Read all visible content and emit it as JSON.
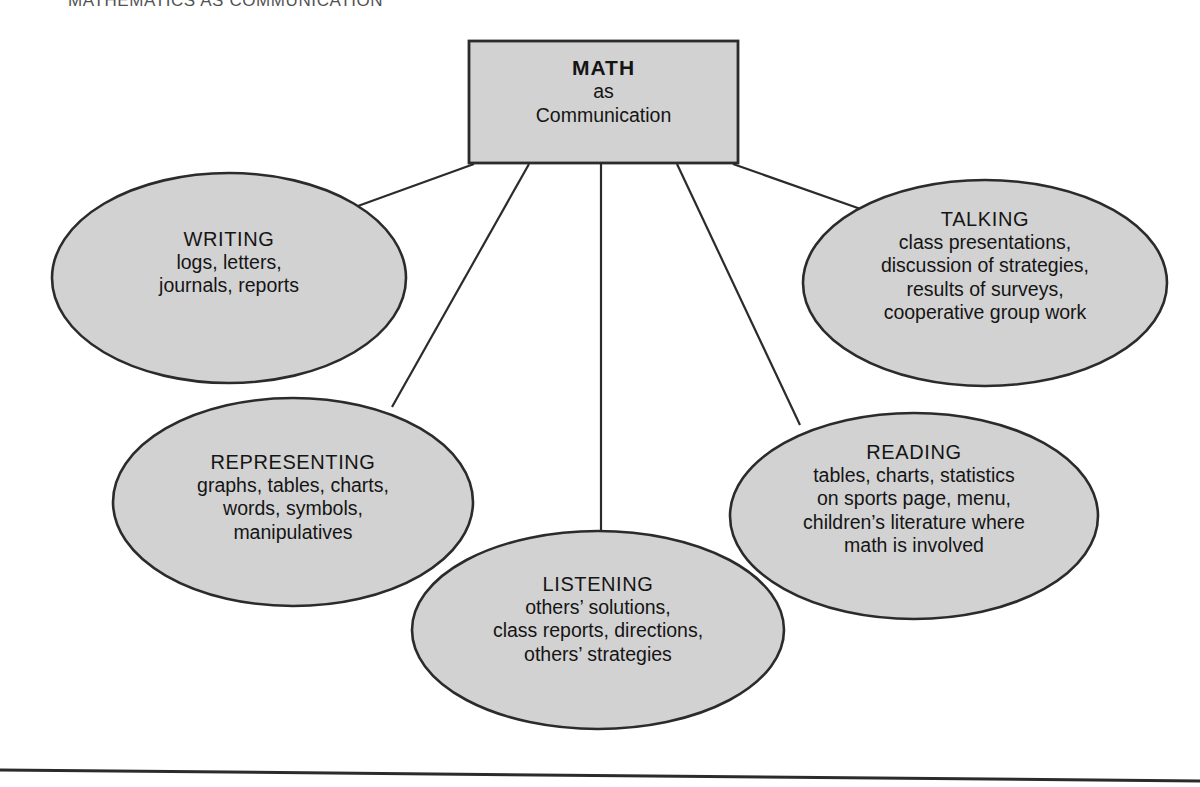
{
  "page": {
    "running_head": "MATHEMATICS AS COMMUNICATION",
    "background_color": "#ffffff",
    "shape_fill_color": "#d2d2d2",
    "shape_stroke_color": "#2b2b2b",
    "text_color": "#151515"
  },
  "center": {
    "title": "MATH",
    "line1": "as",
    "line2": "Communication"
  },
  "nodes": [
    {
      "id": "writing",
      "title": "WRITING",
      "lines": [
        "logs, letters,",
        "journals, reports"
      ]
    },
    {
      "id": "talking",
      "title": "TALKING",
      "lines": [
        "class presentations,",
        "discussion of strategies,",
        "results of surveys,",
        "cooperative group work"
      ]
    },
    {
      "id": "representing",
      "title": "REPRESENTING",
      "lines": [
        "graphs, tables, charts,",
        "words, symbols,",
        "manipulatives"
      ]
    },
    {
      "id": "reading",
      "title": "READING",
      "lines": [
        "tables, charts, statistics",
        "on sports page, menu,",
        "children’s literature where",
        "math is involved"
      ]
    },
    {
      "id": "listening",
      "title": "LISTENING",
      "lines": [
        "others’ solutions,",
        "class reports, directions,",
        "others’ strategies"
      ]
    }
  ]
}
